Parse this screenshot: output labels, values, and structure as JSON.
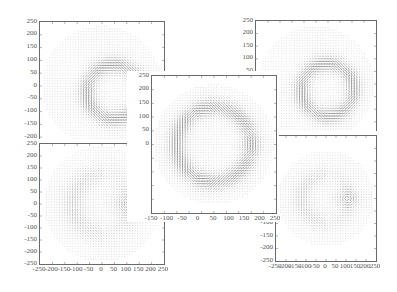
{
  "figure": {
    "panels": [
      {
        "id": "top-left",
        "frame": {
          "x": 39,
          "y": 21,
          "w": 124,
          "h": 128
        },
        "y_ticks": [
          "250",
          "200",
          "150",
          "100",
          "50",
          "0",
          "-50",
          "-100",
          "-150",
          "-200"
        ],
        "y_range": [
          -250,
          250
        ],
        "x_ticks": [],
        "pattern": "ring-left",
        "z": 1
      },
      {
        "id": "top-right",
        "frame": {
          "x": 255,
          "y": 20,
          "w": 120,
          "h": 126
        },
        "y_ticks": [
          "250",
          "200",
          "150",
          "100",
          "50"
        ],
        "y_range": [
          -250,
          250
        ],
        "x_ticks": [],
        "pattern": "ring-right",
        "z": 1
      },
      {
        "id": "bottom-left",
        "frame": {
          "x": 39,
          "y": 143,
          "w": 124,
          "h": 120
        },
        "y_ticks": [
          "250",
          "200",
          "150",
          "100",
          "50",
          "0",
          "-50",
          "-100",
          "-150",
          "-200",
          "-250"
        ],
        "y_range": [
          -250,
          250
        ],
        "x_ticks": [
          "-250",
          "-200",
          "-150",
          "-100",
          "-50",
          "0",
          "50",
          "100",
          "150",
          "200",
          "250"
        ],
        "pattern": "vortex-right",
        "z": 2
      },
      {
        "id": "bottom-right",
        "frame": {
          "x": 275,
          "y": 135,
          "w": 100,
          "h": 125
        },
        "y_ticks": [
          "-100",
          "-150",
          "-200",
          "-250"
        ],
        "y_range": [
          -250,
          250
        ],
        "x_ticks": [
          "-250",
          "-200",
          "-150",
          "-100",
          "-50",
          "0",
          "50",
          "100",
          "150",
          "200",
          "250"
        ],
        "pattern": "vortex-right-2",
        "z": 2
      },
      {
        "id": "center",
        "frame": {
          "x": 151,
          "y": 75,
          "w": 124,
          "h": 137
        },
        "y_ticks": [
          "250",
          "200",
          "150",
          "100",
          "50",
          "0"
        ],
        "y_range": [
          -250,
          250
        ],
        "x_ticks": [
          "-150",
          "-100",
          "-50",
          "0",
          "50",
          "100",
          "150",
          "200",
          "250"
        ],
        "pattern": "concentric-ring",
        "z": 3
      }
    ],
    "colors": {
      "frame": "#6a6a6a",
      "arrows": "#333333",
      "tick_text": "#555555",
      "background": "#ffffff"
    }
  }
}
